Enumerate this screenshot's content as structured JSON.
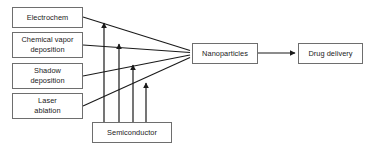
{
  "diagram": {
    "type": "flowchart",
    "orientation": "left-to-right",
    "canvas": {
      "width": 374,
      "height": 151,
      "background": "#ffffff"
    },
    "style": {
      "node_border_color": "#6e6e6e",
      "node_fill": "#ffffff",
      "edge_color": "#1a1a1a",
      "text_color": "#1a1a1a"
    },
    "nodes": [
      {
        "id": "electrochem",
        "label": "Electrochem",
        "x": 12,
        "y": 7,
        "w": 71,
        "h": 21
      },
      {
        "id": "chemical-vapor-deposition",
        "label": "Chemical vapor\ndeposition",
        "x": 12,
        "y": 32,
        "w": 71,
        "h": 26
      },
      {
        "id": "shadow-deposition",
        "label": "Shadow\ndeposition",
        "x": 12,
        "y": 63,
        "w": 71,
        "h": 26
      },
      {
        "id": "laser-ablation",
        "label": "Laser\nablation",
        "x": 12,
        "y": 93,
        "w": 71,
        "h": 26
      },
      {
        "id": "semiconductor",
        "label": "Semiconductor",
        "x": 92,
        "y": 122,
        "w": 80,
        "h": 21
      },
      {
        "id": "nanoparticles",
        "label": "Nanoparticles",
        "x": 192,
        "y": 43,
        "w": 66,
        "h": 21
      },
      {
        "id": "drug-delivery",
        "label": "Drug delivery",
        "x": 298,
        "y": 43,
        "w": 65,
        "h": 21
      }
    ],
    "edges": [
      {
        "id": "electrochem-to-nanoparticles",
        "from": "electrochem",
        "to": "nanoparticles",
        "arrowhead": false,
        "points": "83,17 189,51"
      },
      {
        "id": "cvd-to-nanoparticles",
        "from": "chemical-vapor-deposition",
        "to": "nanoparticles",
        "arrowhead": false,
        "points": "83,45 189,53"
      },
      {
        "id": "shadow-deposition-to-nanoparticles",
        "from": "shadow-deposition",
        "to": "nanoparticles",
        "arrowhead": false,
        "points": "83,76 189,55"
      },
      {
        "id": "laser-ablation-to-nanoparticles",
        "from": "laser-ablation",
        "to": "nanoparticles",
        "arrowhead": false,
        "points": "83,106 189,57"
      },
      {
        "id": "semiconductor-to-electrochem-line",
        "from": "semiconductor",
        "to": "electrochem-line",
        "arrowhead": true,
        "points": "104,122 104,20"
      },
      {
        "id": "semiconductor-to-cvd-line",
        "from": "semiconductor",
        "to": "cvd-line",
        "arrowhead": true,
        "points": "119,122 119,41"
      },
      {
        "id": "semiconductor-to-shadow-line",
        "from": "semiconductor",
        "to": "shadow-line",
        "arrowhead": true,
        "points": "133,122 133,62"
      },
      {
        "id": "semiconductor-to-laser-line",
        "from": "semiconductor",
        "to": "laser-line",
        "arrowhead": true,
        "points": "146,122 146,80"
      },
      {
        "id": "nanoparticles-to-drug-delivery",
        "from": "nanoparticles",
        "to": "drug-delivery",
        "arrowhead": true,
        "points": "258,53 296,53"
      }
    ]
  }
}
